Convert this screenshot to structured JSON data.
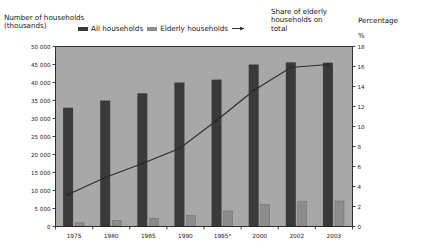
{
  "header": {
    "left_axis_title": "Number of households\n(thousands)",
    "series_note": "Share of elderly\nhouseholds on\ntotal",
    "right_axis_title": "Percentage",
    "right_axis_unit": "%"
  },
  "legend": {
    "items": [
      {
        "label": "All households",
        "marker": "bar-swatch-dark",
        "color": "#3a3a3a"
      },
      {
        "label": "Elderly households",
        "marker": "bar-swatch-grey",
        "color": "#8c8c8c"
      },
      {
        "label": "",
        "marker": "line-arrow-marker",
        "color": "#2b2b2b"
      }
    ]
  },
  "chart_data": {
    "type": "bar",
    "title": "",
    "subtitle": "",
    "xlabel": "",
    "ylabel": "Number of households (thousands)",
    "y2label": "Percentage %",
    "categories": [
      "1975",
      "1980",
      "1985",
      "1990",
      "1995*",
      "2000",
      "2002",
      "2003"
    ],
    "series": [
      {
        "name": "All households",
        "type": "bar",
        "axis": "left",
        "color": "#3a3a3a",
        "values": [
          33000,
          35000,
          37000,
          40000,
          40800,
          45000,
          45600,
          45500
        ]
      },
      {
        "name": "Elderly households",
        "type": "bar",
        "axis": "left",
        "color": "#8c8c8c",
        "values": [
          1000,
          1700,
          2300,
          3100,
          4300,
          6100,
          6900,
          7100
        ]
      },
      {
        "name": "Share of elderly households on total",
        "type": "line",
        "axis": "right",
        "color": "#2b2b2b",
        "values": [
          3.2,
          4.9,
          6.3,
          7.8,
          10.6,
          13.6,
          15.9,
          16.2
        ]
      }
    ],
    "ylim": [
      0,
      50000
    ],
    "yticks": [
      0,
      5000,
      10000,
      15000,
      20000,
      25000,
      30000,
      35000,
      40000,
      45000,
      50000
    ],
    "ytick_labels": [
      "0",
      "5 000",
      "10 000",
      "15 000",
      "20 000",
      "25 000",
      "30 000",
      "35 000",
      "40 000",
      "45 000",
      "50 000"
    ],
    "y2lim": [
      0,
      18
    ],
    "y2ticks": [
      0,
      2,
      4,
      6,
      8,
      10,
      12,
      14,
      16,
      18
    ],
    "y2tick_labels": [
      "0",
      "2",
      "4",
      "6",
      "8",
      "10",
      "12",
      "14",
      "16",
      "18"
    ],
    "grid": false,
    "legend_position": "top",
    "plot_background": "#a8a8a8",
    "footnote": "*"
  }
}
